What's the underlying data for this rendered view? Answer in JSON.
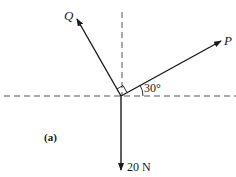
{
  "diagram": {
    "part_label": "(a)",
    "forces": [
      {
        "name": "Q",
        "label": "Q",
        "direction": "up-left, perpendicular to P"
      },
      {
        "name": "P",
        "label": "P",
        "angle_label": "30°"
      },
      {
        "name": "weight",
        "label": "20 N",
        "direction": "down"
      }
    ],
    "angle_label": "30°",
    "right_angle_marker": true,
    "colors": {
      "line": "#1a1a1a",
      "dashed": "#555555",
      "background": "#ffffff"
    }
  }
}
